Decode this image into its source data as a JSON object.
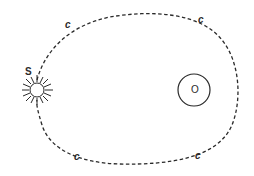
{
  "diagram": {
    "colors": {
      "stroke": "#2a2a2a",
      "background": "#ffffff"
    },
    "labels": {
      "sun": "S",
      "body": "O",
      "orbit_top_left": "c",
      "orbit_top_right": "c",
      "orbit_bottom_left": "c",
      "orbit_bottom_right": "c"
    },
    "shapes": {
      "orbit": {
        "style": "dashed",
        "type": "closed-curve"
      },
      "sun": {
        "type": "circle-with-rays",
        "icon": "sun-icon"
      },
      "body": {
        "type": "circle"
      }
    }
  }
}
